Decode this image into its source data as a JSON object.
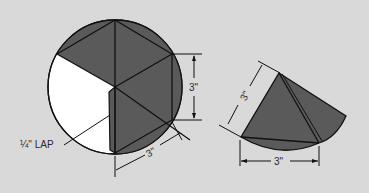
{
  "colors": {
    "background": "#d9d9d9",
    "shaded": "#5a5a5a",
    "unshaded": "#ffffff",
    "line": "#111111"
  },
  "left_figure": {
    "description": "Circular paper disk divided into six triangles; one sector cut out and lapped to form a cone",
    "dimension_vertical": "3\"",
    "dimension_diagonal": "3\"",
    "lap_label": "¼\" LAP"
  },
  "right_figure": {
    "description": "Resulting folded cone shape",
    "dimension_slant": "3\"",
    "dimension_base": "3\""
  }
}
